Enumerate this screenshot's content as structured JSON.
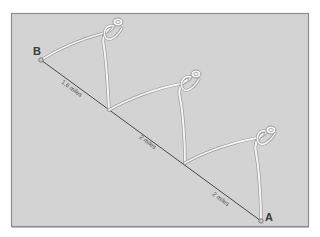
{
  "diagram": {
    "colors": {
      "panel": "#d3d3d3",
      "panel_border": "#8f8f8f",
      "line": "#4a4a4a",
      "divider_fill": "#f4f4f4",
      "divider_stroke": "#9a9a9a"
    },
    "points": [
      {
        "id": "B",
        "label": "B",
        "x": 41,
        "y": 60
      },
      {
        "id": "A",
        "label": "A",
        "x": 261,
        "y": 221
      }
    ],
    "segments": [
      {
        "label": "1.6 miles",
        "x": 70,
        "y": 87
      },
      {
        "label": "2 miles",
        "x": 145,
        "y": 142
      },
      {
        "label": "2 miles",
        "x": 218,
        "y": 199
      }
    ],
    "dividers": [
      {
        "from": [
          41,
          60
        ],
        "to": [
          109,
          110
        ],
        "head": [
          118,
          22
        ]
      },
      {
        "from": [
          109,
          110
        ],
        "to": [
          185,
          163
        ],
        "head": [
          196,
          74
        ]
      },
      {
        "from": [
          185,
          163
        ],
        "to": [
          261,
          221
        ],
        "head": [
          271,
          130
        ]
      }
    ]
  }
}
